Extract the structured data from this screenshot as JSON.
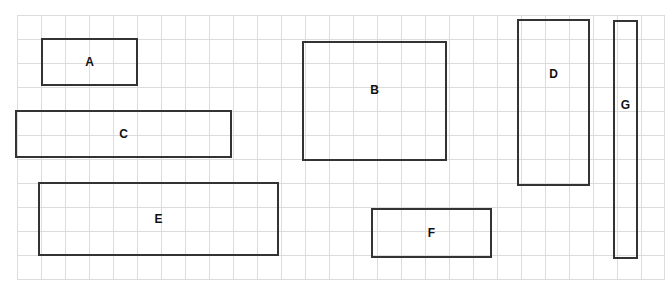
{
  "diagram": {
    "grid": {
      "cell_size": 24,
      "line_color": "#dcdcdc"
    },
    "box_border_color": "#333333",
    "boxes": [
      {
        "label": "A",
        "x": 41,
        "y": 38,
        "w": 97,
        "h": 48
      },
      {
        "label": "B",
        "x": 302,
        "y": 41,
        "w": 145,
        "h": 120
      },
      {
        "label": "C",
        "x": 15,
        "y": 110,
        "w": 217,
        "h": 48
      },
      {
        "label": "D",
        "x": 517,
        "y": 19,
        "w": 73,
        "h": 167
      },
      {
        "label": "E",
        "x": 38,
        "y": 182,
        "w": 241,
        "h": 74
      },
      {
        "label": "F",
        "x": 371,
        "y": 208,
        "w": 121,
        "h": 50
      },
      {
        "label": "G",
        "x": 613,
        "y": 20,
        "w": 25,
        "h": 239
      }
    ]
  }
}
